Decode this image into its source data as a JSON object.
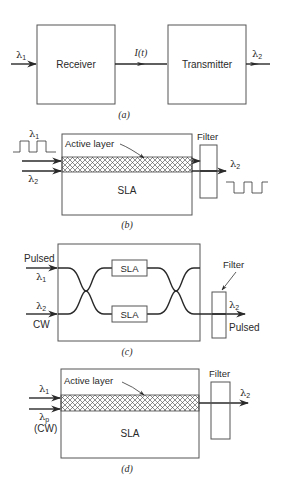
{
  "figure": {
    "panel_a": {
      "caption": "(a)",
      "input_label": "λ",
      "input_sub": "1",
      "receiver_label": "Receiver",
      "signal_label": "I(t)",
      "transmitter_label": "Transmitter",
      "output_label": "λ",
      "output_sub": "2"
    },
    "panel_b": {
      "caption": "(b)",
      "pump_label": "λ",
      "pump_sub": "1",
      "probe_label": "λ",
      "probe_sub": "2",
      "active_layer_label": "Active layer",
      "device_label": "SLA",
      "filter_label": "Filter",
      "output_label": "λ",
      "output_sub": "2"
    },
    "panel_c": {
      "caption": "(c)",
      "input1_top": "Pulsed",
      "input1_label": "λ",
      "input1_sub": "1",
      "input2_label": "λ",
      "input2_sub": "2",
      "input2_bottom": "CW",
      "sla_upper": "SLA",
      "sla_lower": "SLA",
      "filter_label": "Filter",
      "output_label": "λ",
      "output_sub": "2",
      "output_bottom": "Pulsed"
    },
    "panel_d": {
      "caption": "(d)",
      "input1_label": "λ",
      "input1_sub": "1",
      "input2_label": "λ",
      "input2_sub": "p",
      "input2_bottom": "(CW)",
      "active_layer_label": "Active layer",
      "device_label": "SLA",
      "filter_label": "Filter",
      "output_label": "λ",
      "output_sub": "2"
    }
  }
}
